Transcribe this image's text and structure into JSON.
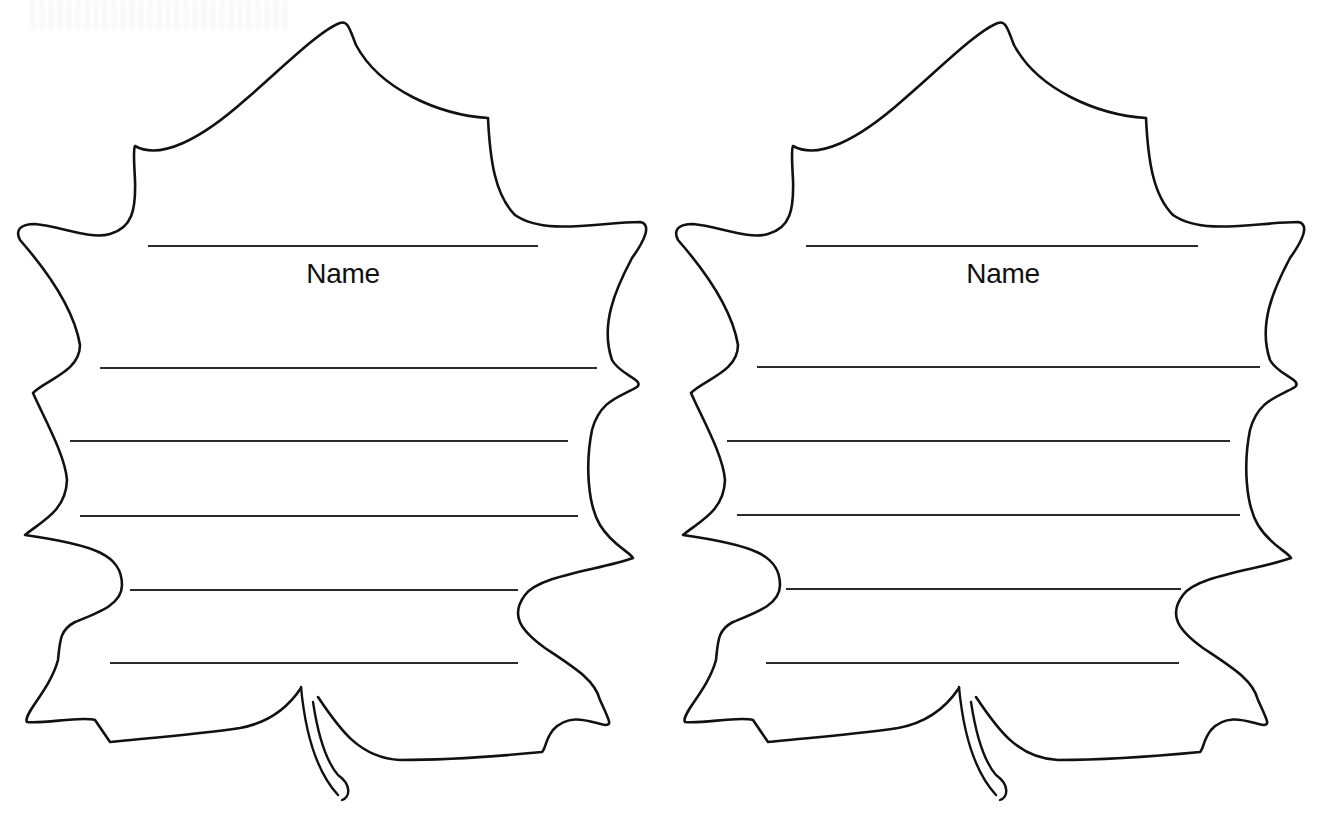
{
  "worksheet": {
    "leaves": [
      {
        "id": "left",
        "offset_x": 0,
        "name_label": "Name",
        "name_line": {
          "x1": 148,
          "x2": 538,
          "y": 246
        },
        "writing_lines": [
          {
            "x1": 100,
            "x2": 597,
            "y": 368
          },
          {
            "x1": 70,
            "x2": 568,
            "y": 441
          },
          {
            "x1": 80,
            "x2": 578,
            "y": 516
          },
          {
            "x1": 130,
            "x2": 518,
            "y": 590
          },
          {
            "x1": 110,
            "x2": 518,
            "y": 663
          }
        ]
      },
      {
        "id": "right",
        "offset_x": 658,
        "name_label": "Name",
        "name_line": {
          "x1": 148,
          "x2": 540,
          "y": 246
        },
        "writing_lines": [
          {
            "x1": 99,
            "x2": 602,
            "y": 367
          },
          {
            "x1": 69,
            "x2": 572,
            "y": 441
          },
          {
            "x1": 79,
            "x2": 582,
            "y": 515
          },
          {
            "x1": 128,
            "x2": 523,
            "y": 589
          },
          {
            "x1": 108,
            "x2": 521,
            "y": 663
          }
        ]
      }
    ],
    "colors": {
      "ink": "#111111",
      "rule": "#2a2a2a",
      "paper": "#ffffff"
    },
    "icons": {
      "leaf_shape": "maple-leaf-outline-icon",
      "stem": "leaf-stem-icon"
    }
  }
}
